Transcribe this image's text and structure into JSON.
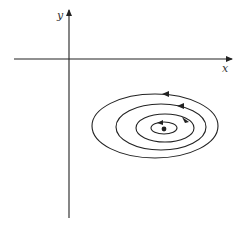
{
  "diagram": {
    "type": "phase-portrait",
    "axes": {
      "x_label": "x",
      "y_label": "y"
    },
    "colors": {
      "stroke": "#222222",
      "background": "#ffffff"
    },
    "orbits": [
      {
        "cx": 155,
        "cy": 126,
        "rx": 63,
        "ry": 32,
        "direction": "counterclockwise"
      },
      {
        "cx": 161,
        "cy": 127,
        "rx": 45,
        "ry": 23,
        "direction": "counterclockwise"
      },
      {
        "cx": 165,
        "cy": 128,
        "rx": 29,
        "ry": 14,
        "direction": "counterclockwise"
      },
      {
        "cx": 164,
        "cy": 128,
        "rx": 13,
        "ry": 6,
        "direction": "counterclockwise"
      }
    ],
    "equilibrium_point": {
      "cx": 164,
      "cy": 129
    }
  }
}
